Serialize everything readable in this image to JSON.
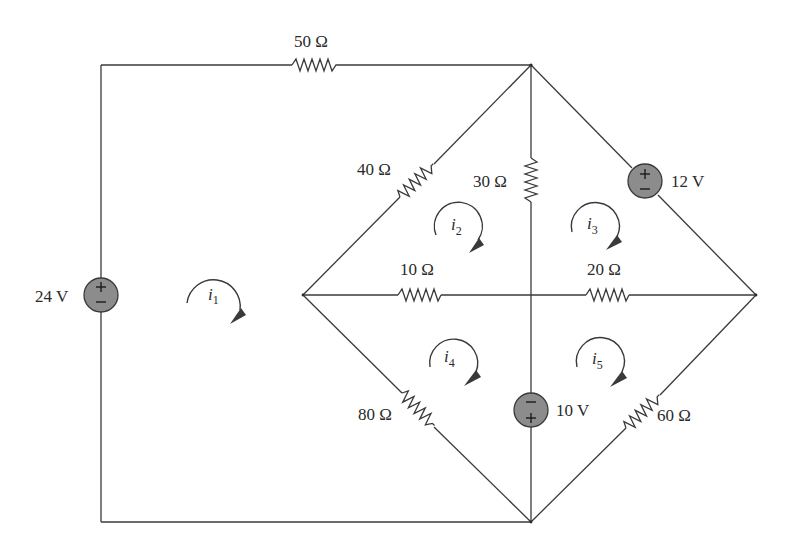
{
  "diagram": {
    "type": "circuit-schematic",
    "title": "",
    "colors": {
      "wire": "#3a3a3a",
      "source_fill": "#8c8c8c",
      "text": "#2a2a2a",
      "background": "#ffffff"
    },
    "resistors": [
      {
        "id": "R50",
        "label": "50 Ω",
        "value_ohm": 50,
        "branch": "top wire between left corner and top node"
      },
      {
        "id": "R40",
        "label": "40 Ω",
        "value_ohm": 40,
        "branch": "left node to top node"
      },
      {
        "id": "R30",
        "label": "30 Ω",
        "value_ohm": 30,
        "branch": "top node to center (vertical)"
      },
      {
        "id": "R10",
        "label": "10 Ω",
        "value_ohm": 10,
        "branch": "left node to center (horizontal)"
      },
      {
        "id": "R20",
        "label": "20 Ω",
        "value_ohm": 20,
        "branch": "center to right node (horizontal)"
      },
      {
        "id": "R80",
        "label": "80 Ω",
        "value_ohm": 80,
        "branch": "left node to bottom node"
      },
      {
        "id": "R60",
        "label": "60 Ω",
        "value_ohm": 60,
        "branch": "bottom node to right node"
      }
    ],
    "sources": [
      {
        "id": "V24",
        "label": "24 V",
        "value_v": 24,
        "top_sign": "+",
        "bottom_sign": "−",
        "branch": "left vertical wire"
      },
      {
        "id": "V12",
        "label": "12 V",
        "value_v": 12,
        "top_sign": "+",
        "bottom_sign": "−",
        "branch": "top node to right node"
      },
      {
        "id": "V10",
        "label": "10 V",
        "value_v": 10,
        "top_sign": "−",
        "bottom_sign": "+",
        "branch": "center to bottom node (vertical)"
      }
    ],
    "meshes": [
      {
        "id": "i1",
        "symbol": "i",
        "subscript": "1",
        "direction": "clockwise"
      },
      {
        "id": "i2",
        "symbol": "i",
        "subscript": "2",
        "direction": "clockwise"
      },
      {
        "id": "i3",
        "symbol": "i",
        "subscript": "3",
        "direction": "clockwise"
      },
      {
        "id": "i4",
        "symbol": "i",
        "subscript": "4",
        "direction": "clockwise"
      },
      {
        "id": "i5",
        "symbol": "i",
        "subscript": "5",
        "direction": "clockwise"
      }
    ]
  }
}
